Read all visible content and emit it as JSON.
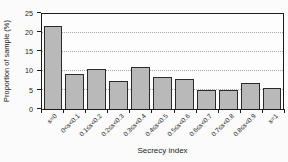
{
  "figure": {
    "background": "#fbfbfb"
  },
  "chart_data": {
    "type": "bar",
    "title": "",
    "xlabel": "Secrecy index",
    "ylabel": "Proportion of sample (%)",
    "categories": [
      "s=0",
      "0<s<0.1",
      "0.1≤s<0.2",
      "0.2≤s<0.3",
      "0.3≤s<0.4",
      "0.4≤s<0.5",
      "0.5≤s<0.6",
      "0.6≤s<0.7",
      "0.7≤s<0.8",
      "0.8≤s<0.9",
      "s=1"
    ],
    "values": [
      21.8,
      9.3,
      10.4,
      7.4,
      11.0,
      8.5,
      7.9,
      5.0,
      5.0,
      6.8,
      5.6
    ],
    "ylim": [
      0,
      25
    ],
    "yticks": [
      0,
      5,
      10,
      15,
      20,
      25
    ],
    "gridlines": [
      5,
      10,
      15,
      20
    ],
    "grid": true,
    "legend": "none",
    "x_tick_rotation_deg": 45,
    "colors": {
      "background": "#fbfbfb",
      "bar_fill": "#b9b9b9",
      "bar_border": "#2b2b2b",
      "axis": "#1c1c1c",
      "gridline": "#a8a8a8",
      "text": "#1c1c1c"
    }
  }
}
